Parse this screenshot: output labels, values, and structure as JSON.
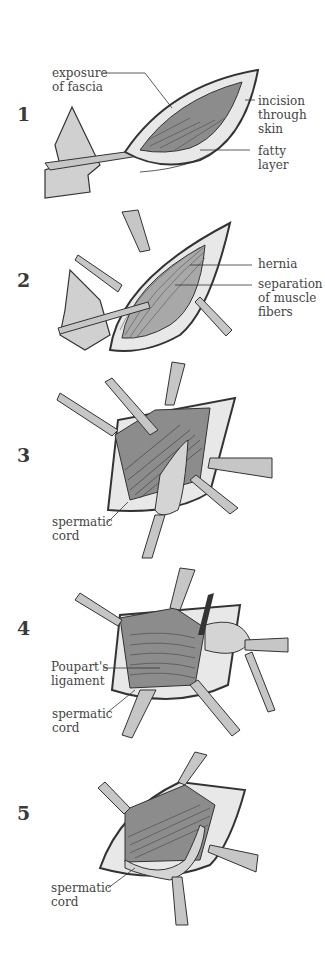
{
  "figure": {
    "steps": [
      {
        "number": "1",
        "labels": {
          "exposure": "exposure\nof fascia",
          "incision": "incision\nthrough\nskin",
          "fatty": "fatty\nlayer"
        }
      },
      {
        "number": "2",
        "labels": {
          "hernia": "hernia",
          "separation": "separation\nof muscle\nfibers"
        }
      },
      {
        "number": "3",
        "labels": {
          "cord": "spermatic\ncord"
        }
      },
      {
        "number": "4",
        "labels": {
          "poupart": "Poupart's\nligament",
          "cord": "spermatic\ncord"
        }
      },
      {
        "number": "5",
        "labels": {
          "cord": "spermatic\ncord"
        }
      }
    ],
    "colors": {
      "outline": "#333333",
      "tissue_dark": "#8c8c8c",
      "tissue_mid": "#a8a8a8",
      "tissue_light": "#d4d4d4",
      "skin": "#e8e8e8",
      "instrument": "#c6c6c6"
    }
  }
}
